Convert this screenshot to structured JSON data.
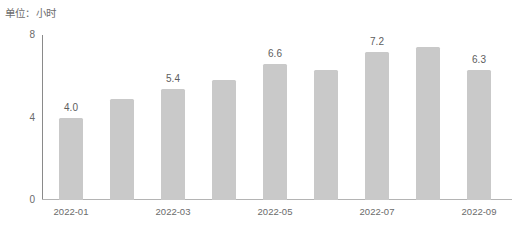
{
  "caption": {
    "unit_label": "单位：小时"
  },
  "chart_data": {
    "type": "bar",
    "title": "",
    "subtitle": "",
    "xlabel": "",
    "ylabel": "单位：小时",
    "categories": [
      "2022-01",
      "2022-02",
      "2022-03",
      "2022-04",
      "2022-05",
      "2022-06",
      "2022-07",
      "2022-08",
      "2022-09"
    ],
    "values": [
      4.0,
      4.9,
      5.4,
      5.8,
      6.6,
      6.3,
      7.2,
      7.4,
      6.3
    ],
    "point_labels": [
      "4.0",
      "",
      "5.4",
      "",
      "6.6",
      "",
      "7.2",
      "",
      "6.3"
    ],
    "point_labels_visible": [
      true,
      false,
      true,
      false,
      true,
      false,
      true,
      false,
      true
    ],
    "x_tick_labels": [
      "2022-01",
      "2022-03",
      "2022-05",
      "2022-07",
      "2022-09"
    ],
    "x_tick_indices": [
      0,
      2,
      4,
      6,
      8
    ],
    "y_ticks": [
      0,
      4,
      8
    ],
    "y_tick_labels": [
      "0",
      "4",
      "8"
    ],
    "ylim": [
      0,
      8
    ],
    "grid": false,
    "legend": false,
    "legend_position": "none",
    "bar_color": "#c9c9c9",
    "axis_color": "#8a8a8a",
    "text_color": "#6b6b6b"
  }
}
